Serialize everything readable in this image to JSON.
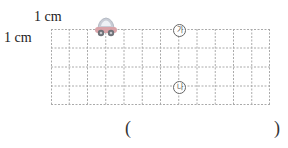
{
  "labels": {
    "horizontal_unit": "1 cm",
    "vertical_unit": "1 cm"
  },
  "grid": {
    "columns": 12,
    "rows": 4,
    "cell_unit": "1 cm",
    "line_style": "dashed",
    "line_color": "#aaaaaa"
  },
  "icons": {
    "car": "car-icon"
  },
  "markers": [
    {
      "id": "ga",
      "label": "가"
    },
    {
      "id": "na",
      "label": "나"
    }
  ],
  "answer": {
    "open_paren": "(",
    "close_paren": ")",
    "value": ""
  }
}
